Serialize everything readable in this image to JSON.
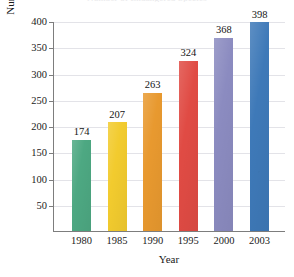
{
  "chart_data": {
    "type": "bar",
    "title": "Number of Endangered Species",
    "xlabel": "Year",
    "ylabel": "Number of Endangered Species",
    "categories": [
      "1980",
      "1985",
      "1990",
      "1995",
      "2000",
      "2003"
    ],
    "values": [
      174,
      207,
      263,
      324,
      368,
      398
    ],
    "value_labels": [
      "174",
      "207",
      "263",
      "324",
      "368",
      "398"
    ],
    "bar_colors": [
      "#4da882",
      "#f2cb2e",
      "#e8992f",
      "#e04b44",
      "#8b8bc0",
      "#3e79b8"
    ],
    "ylim": [
      0,
      400
    ],
    "ytick_labels": [
      "400",
      "350",
      "300",
      "250",
      "200",
      "150",
      "100",
      "50"
    ],
    "ytick_values": [
      400,
      350,
      300,
      250,
      200,
      150,
      100,
      50
    ],
    "grid": true,
    "legend": "none"
  }
}
